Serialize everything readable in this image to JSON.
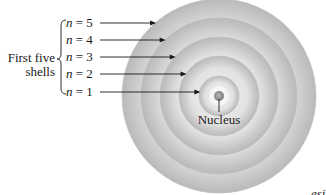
{
  "diagram": {
    "group_label_line1": "First five",
    "group_label_line2": "shells",
    "nucleus_label": "Nucleus",
    "corner_text": "esi",
    "shells": [
      {
        "n": 5,
        "label_var": "n",
        "label_eq": " = 5"
      },
      {
        "n": 4,
        "label_var": "n",
        "label_eq": " = 4"
      },
      {
        "n": 3,
        "label_var": "n",
        "label_eq": " = 3"
      },
      {
        "n": 2,
        "label_var": "n",
        "label_eq": " = 2"
      },
      {
        "n": 1,
        "label_var": "n",
        "label_eq": " = 1"
      }
    ],
    "colors": {
      "shell_light": "#f2f2f2",
      "shell_dark": "#a9a9a9",
      "nucleus": "#8c8c8c",
      "ink": "#1a1a1a"
    }
  }
}
